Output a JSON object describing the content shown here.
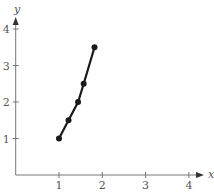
{
  "chart_data": {
    "type": "line",
    "title": "",
    "xlabel": "x",
    "ylabel": "y",
    "xlim": [
      0,
      4.3
    ],
    "ylim": [
      0,
      4.2
    ],
    "grid": false,
    "legend": null,
    "x_ticks": [
      "1",
      "2",
      "3",
      "4"
    ],
    "y_ticks": [
      "1",
      "2",
      "3",
      "4"
    ],
    "series": [
      {
        "name": "curve",
        "markers": true,
        "points": [
          {
            "x": 1.0,
            "y": 1.0
          },
          {
            "x": 1.22,
            "y": 1.5
          },
          {
            "x": 1.44,
            "y": 2.0
          },
          {
            "x": 1.57,
            "y": 2.5
          },
          {
            "x": 1.82,
            "y": 3.5
          }
        ]
      }
    ]
  },
  "style": {
    "axis_color": "#777777",
    "line_color": "#1a1a1a",
    "text_color": "#555555"
  }
}
